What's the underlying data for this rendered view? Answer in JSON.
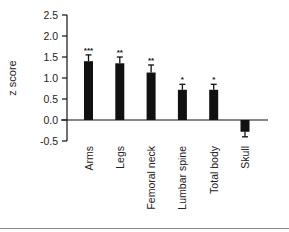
{
  "chart_data": {
    "type": "bar",
    "title": "",
    "xlabel": "",
    "ylabel": "z score",
    "ylim": [
      -0.5,
      2.5
    ],
    "yticks": [
      2.5,
      2.0,
      1.5,
      1.0,
      0.5,
      0.0,
      -0.5
    ],
    "ytick_labels": [
      "2.5",
      "2.0",
      "1.5",
      "1.0",
      "0.5",
      "0.0",
      "-0.5"
    ],
    "categories": [
      "Arms",
      "Legs",
      "Femoral neck",
      "Lumbar spine",
      "Total body",
      "Skull"
    ],
    "values": [
      1.4,
      1.35,
      1.13,
      0.72,
      0.72,
      -0.28
    ],
    "error": [
      0.15,
      0.15,
      0.18,
      0.13,
      0.13,
      0.12
    ],
    "significance": [
      "***",
      "**",
      "**",
      "*",
      "*",
      ""
    ],
    "bar_color": "#111111",
    "grid": false,
    "legend": null
  }
}
